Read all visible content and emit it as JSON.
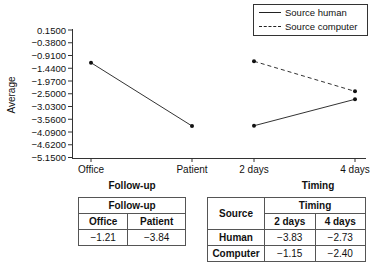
{
  "chart_data": [
    {
      "type": "line",
      "title": "",
      "xlabel": "",
      "ylabel": "Average",
      "ylim": [
        -5.15,
        0.15
      ],
      "y_ticks": [
        "0.1500",
        "-0.3800",
        "-0.9100",
        "-1.4400",
        "-1.9700",
        "-2.5000",
        "-3.0300",
        "-3.5600",
        "-4.0900",
        "-4.6200",
        "-5.1500"
      ],
      "categories": [
        "Office",
        "Patient",
        "2 days",
        "4 days"
      ],
      "grid": false,
      "legend_position": "top-right",
      "legend": [
        "Source human",
        "Source computer"
      ],
      "series": [
        {
          "name": "Follow-up",
          "style": "solid",
          "x": [
            "Office",
            "Patient"
          ],
          "values": [
            -1.21,
            -3.84
          ]
        },
        {
          "name": "Source human",
          "style": "solid",
          "x": [
            "2 days",
            "4 days"
          ],
          "values": [
            -3.83,
            -2.73
          ]
        },
        {
          "name": "Source computer",
          "style": "dashed",
          "x": [
            "2 days",
            "4 days"
          ],
          "values": [
            -1.15,
            -2.4
          ]
        }
      ]
    },
    {
      "type": "table",
      "title": "Follow-up",
      "header": "Follow-up",
      "columns": [
        "Office",
        "Patient"
      ],
      "rows": [
        [
          "-1.21",
          "-3.84"
        ]
      ]
    },
    {
      "type": "table",
      "title": "Timing",
      "row_header": "Source",
      "header": "Timing",
      "columns": [
        "2 days",
        "4 days"
      ],
      "rows": [
        {
          "label": "Human",
          "values": [
            "-3.83",
            "-2.73"
          ]
        },
        {
          "label": "Computer",
          "values": [
            "-1.15",
            "-2.40"
          ]
        }
      ]
    }
  ],
  "axis": {
    "ylabel": "Average",
    "y_ticks": [
      "0.1500",
      "−0.3800",
      "−0.9100",
      "−1.4400",
      "−1.9700",
      "−2.5000",
      "−3.0300",
      "−3.5600",
      "−4.0900",
      "−4.6200",
      "−5.1500"
    ],
    "categories": [
      "Office",
      "Patient",
      "2 days",
      "4 days"
    ]
  },
  "legend": {
    "human": "Source human",
    "computer": "Source computer"
  },
  "followup_table": {
    "title": "Follow-up",
    "header": "Follow-up",
    "col1": "Office",
    "col2": "Patient",
    "val1": "−1.21",
    "val2": "−3.84"
  },
  "timing_table": {
    "title": "Timing",
    "source_header": "Source",
    "header": "Timing",
    "col1": "2 days",
    "col2": "4 days",
    "rows": [
      {
        "label": "Human",
        "v1": "−3.83",
        "v2": "−2.73"
      },
      {
        "label": "Computer",
        "v1": "−1.15",
        "v2": "−2.40"
      }
    ]
  }
}
